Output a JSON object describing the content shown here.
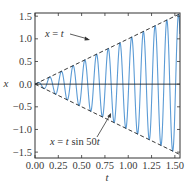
{
  "chart_data": {
    "type": "line",
    "title": "",
    "xlabel": "t",
    "ylabel": "x",
    "xlim": [
      0,
      1.555
    ],
    "ylim": [
      -1.63,
      1.57
    ],
    "grid": false,
    "xticks": [
      0.0,
      0.25,
      0.5,
      0.75,
      1.0,
      1.25,
      1.5
    ],
    "xtick_labels": [
      "0.00",
      "0.25",
      "0.50",
      "0.75",
      "1.00",
      "1.25",
      "1.50"
    ],
    "yticks": [
      -1.5,
      -1.0,
      -0.5,
      0.0,
      0.5,
      1.0,
      1.5
    ],
    "ytick_labels": [
      "−1.5",
      "−1.0",
      "−0.5",
      "0.0",
      "0.5",
      "1.0",
      "1.5"
    ],
    "series": [
      {
        "name": "x = t sin 50t",
        "function": "t*sin(50*t)",
        "t_range": [
          0,
          1.555
        ],
        "style": "solid",
        "color": "#5b9bd5"
      },
      {
        "name": "x = t",
        "function": "t",
        "t_range": [
          0,
          1.555
        ],
        "style": "dashed",
        "color": "#222222"
      },
      {
        "name": "x = -t",
        "function": "-t",
        "t_range": [
          0,
          1.555
        ],
        "style": "dashed",
        "color": "#222222"
      },
      {
        "name": "x = 0",
        "function": "0",
        "t_range": [
          0,
          1.555
        ],
        "style": "solid",
        "color": "#222222"
      }
    ],
    "annotations": [
      {
        "text_prefix": "x",
        "text_mid": " = ",
        "text_suffix": "t",
        "full_text": "x = t",
        "points_to": [
          0.7,
          0.7
        ]
      },
      {
        "text_prefix": "x",
        "text_mid": " = ",
        "text_t": "t",
        "text_sin": " sin 50",
        "text_t2": "t",
        "full_text": "x = t sin 50t",
        "points_to": [
          0.88,
          -0.88
        ]
      }
    ]
  }
}
